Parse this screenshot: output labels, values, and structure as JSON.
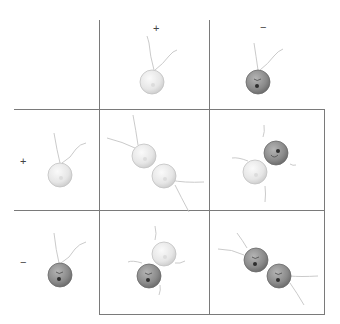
{
  "diagram": {
    "column_headers": [
      "+",
      "−"
    ],
    "row_headers": [
      "+",
      "−"
    ],
    "colors": {
      "grid_line": "#7a7a7a",
      "plus_cell_fill": "#ececec",
      "plus_cell_stroke": "#bdbdbd",
      "minus_cell_fill": "#8e8e8e",
      "minus_cell_stroke": "#6a6a6a",
      "flagellum": "#c4c4c4",
      "nucleus": "#333333"
    },
    "header_cells": [
      {
        "position": "column-header-plus",
        "cell_type": "+"
      },
      {
        "position": "column-header-minus",
        "cell_type": "−"
      },
      {
        "position": "row-header-plus",
        "cell_type": "+"
      },
      {
        "position": "row-header-minus",
        "cell_type": "−"
      }
    ],
    "pairings": [
      {
        "row": "+",
        "column": "+",
        "cells": [
          "+",
          "+"
        ]
      },
      {
        "row": "+",
        "column": "−",
        "cells": [
          "+",
          "−"
        ]
      },
      {
        "row": "−",
        "column": "+",
        "cells": [
          "−",
          "+"
        ]
      },
      {
        "row": "−",
        "column": "−",
        "cells": [
          "−",
          "−"
        ]
      }
    ]
  }
}
